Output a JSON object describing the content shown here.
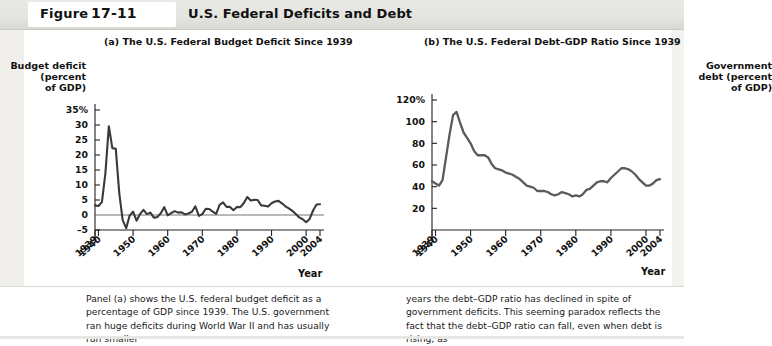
{
  "header": {
    "figure_word": "Figure",
    "figure_number": "17-11",
    "title": "U.S. Federal Deficits and Debt"
  },
  "panels": {
    "a_title": "(a) The U.S. Federal Budget Deficit Since 1939",
    "b_title": "(b) The U.S. Federal Debt–GDP Ratio Since 1939"
  },
  "caption": {
    "left": "Panel (a) shows the U.S. federal budget deficit as a percentage of GDP since 1939. The U.S. government ran huge deficits during World War II and has usually run smaller",
    "right": "years the debt–GDP ratio has declined in spite of government deficits. This seeming paradox reflects the fact that the debt–GDP ratio can fall, even when debt is rising, as"
  },
  "colors": {
    "series_a": "#3a3a38",
    "series_b": "#5d5a57",
    "axis": "#231f20",
    "header_band": "#e4e4e0",
    "page": "#ffffff"
  },
  "chart_data": [
    {
      "type": "line",
      "id": "panel-a",
      "title": "(a) The U.S. Federal Budget Deficit Since 1939",
      "ylabel": "Budget deficit (percent of GDP)",
      "xlabel": "Year",
      "ylim": [
        -5,
        35
      ],
      "xlim": [
        1939,
        2004
      ],
      "yticks": [
        -5,
        0,
        5,
        10,
        15,
        20,
        25,
        30,
        35
      ],
      "yticklabels": [
        "–5",
        "0",
        "5",
        "10",
        "15",
        "20",
        "25",
        "30",
        "35%"
      ],
      "xticks": [
        1939,
        1940,
        1950,
        1960,
        1970,
        1980,
        1990,
        2000,
        2004
      ],
      "xticklabels": [
        "1939",
        "1940",
        "1950",
        "1960",
        "1970",
        "1980",
        "1990",
        "2000",
        "2004"
      ],
      "grid": false,
      "legend": false,
      "zero_line": true,
      "x": [
        1939,
        1940,
        1941,
        1942,
        1943,
        1944,
        1945,
        1946,
        1947,
        1948,
        1949,
        1950,
        1951,
        1952,
        1953,
        1954,
        1955,
        1956,
        1957,
        1958,
        1959,
        1960,
        1961,
        1962,
        1963,
        1964,
        1965,
        1966,
        1967,
        1968,
        1969,
        1970,
        1971,
        1972,
        1973,
        1974,
        1975,
        1976,
        1977,
        1978,
        1979,
        1980,
        1981,
        1982,
        1983,
        1984,
        1985,
        1986,
        1987,
        1988,
        1989,
        1990,
        1991,
        1992,
        1993,
        1994,
        1995,
        1996,
        1997,
        1998,
        1999,
        2000,
        2001,
        2002,
        2003,
        2004
      ],
      "values": [
        3.2,
        3.0,
        4.3,
        13.9,
        29.6,
        22.3,
        22.1,
        7.4,
        -1.7,
        -4.4,
        -0.2,
        1.1,
        -1.9,
        0.3,
        1.7,
        0.3,
        0.8,
        -0.9,
        -0.7,
        0.6,
        2.6,
        -0.1,
        0.6,
        1.3,
        0.8,
        0.9,
        0.2,
        0.5,
        1.1,
        2.9,
        -0.3,
        0.3,
        2.1,
        2.0,
        1.1,
        0.4,
        3.4,
        4.2,
        2.7,
        2.7,
        1.6,
        2.7,
        2.6,
        4.0,
        6.0,
        4.8,
        5.1,
        5.0,
        3.2,
        3.1,
        2.8,
        3.9,
        4.5,
        4.7,
        3.9,
        2.9,
        2.2,
        1.4,
        0.3,
        -0.8,
        -1.4,
        -2.4,
        -1.3,
        1.5,
        3.5,
        3.6
      ],
      "series_name": "Budget deficit (% of GDP)"
    },
    {
      "type": "line",
      "id": "panel-b",
      "title": "(b) The U.S. Federal Debt–GDP Ratio Since 1939",
      "ylabel": "Government debt (percent of GDP)",
      "xlabel": "Year",
      "ylim": [
        0,
        120
      ],
      "xlim": [
        1939,
        2004
      ],
      "yticks": [
        20,
        40,
        60,
        80,
        100,
        120
      ],
      "yticklabels": [
        "20",
        "40",
        "60",
        "80",
        "100",
        "120%"
      ],
      "xticks": [
        1939,
        1940,
        1950,
        1960,
        1970,
        1980,
        1990,
        2000,
        2004
      ],
      "xticklabels": [
        "1939",
        "1940",
        "1950",
        "1960",
        "1970",
        "1980",
        "1990",
        "2000",
        "2004"
      ],
      "grid": false,
      "legend": false,
      "zero_line": false,
      "x": [
        1939,
        1940,
        1941,
        1942,
        1943,
        1944,
        1945,
        1946,
        1947,
        1948,
        1949,
        1950,
        1951,
        1952,
        1953,
        1954,
        1955,
        1956,
        1957,
        1958,
        1959,
        1960,
        1961,
        1962,
        1963,
        1964,
        1965,
        1966,
        1967,
        1968,
        1969,
        1970,
        1971,
        1972,
        1973,
        1974,
        1975,
        1976,
        1977,
        1978,
        1979,
        1980,
        1981,
        1982,
        1983,
        1984,
        1985,
        1986,
        1987,
        1988,
        1989,
        1990,
        1991,
        1992,
        1993,
        1994,
        1995,
        1996,
        1997,
        1998,
        1999,
        2000,
        2001,
        2002,
        2003,
        2004
      ],
      "values": [
        45,
        43,
        41,
        46,
        67,
        88,
        106,
        109,
        99,
        90,
        85,
        80,
        73,
        69,
        69,
        69,
        67,
        61,
        57,
        56,
        55,
        53,
        52,
        51,
        49,
        47,
        44,
        41,
        40,
        39,
        36,
        36,
        36,
        35,
        33,
        32,
        33,
        35,
        34,
        33,
        31,
        32,
        31,
        33,
        37,
        38,
        41,
        44,
        45,
        45,
        44,
        48,
        51,
        54,
        57,
        57,
        56,
        54,
        51,
        47,
        44,
        41,
        41,
        43,
        46,
        47
      ],
      "series_name": "Government debt (% of GDP)"
    }
  ]
}
